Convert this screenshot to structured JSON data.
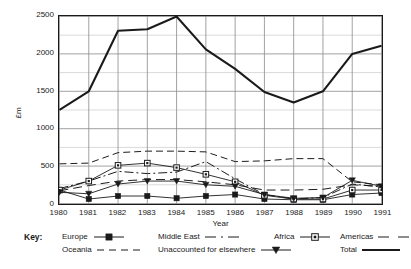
{
  "chart_data": {
    "type": "line",
    "title": "",
    "xlabel": "Year",
    "ylabel": "£m",
    "x": [
      1980,
      1981,
      1982,
      1983,
      1984,
      1985,
      1986,
      1987,
      1988,
      1989,
      1990,
      1991
    ],
    "categories": [
      "1980",
      "1981",
      "1982",
      "1983",
      "1984",
      "1985",
      "1986",
      "1987",
      "1988",
      "1989",
      "1990",
      "1991"
    ],
    "xlim": [
      1980,
      1991
    ],
    "ylim": [
      0,
      2500
    ],
    "ytick_values": [
      0,
      500,
      1000,
      1500,
      2000,
      2500
    ],
    "ytick_labels": [
      "0",
      "500",
      "1000",
      "1500",
      "2000",
      "2500"
    ],
    "y_minor_step": 250,
    "grid": "both axes, light grey minor gridlines every 250 on y and at each year on x",
    "legend_position": "below plot, two rows, labelled 'Key:'",
    "series": [
      {
        "name": "Europe",
        "style": "solid line with filled square markers",
        "marker": "filled-square",
        "dash": "solid",
        "values": [
          180,
          60,
          100,
          100,
          70,
          100,
          120,
          60,
          50,
          50,
          120,
          140
        ]
      },
      {
        "name": "Middle East",
        "style": "dash-dot line, no markers",
        "marker": "none",
        "dash": "dash-dot",
        "values": [
          200,
          300,
          430,
          400,
          420,
          560,
          330,
          120,
          60,
          80,
          260,
          220
        ]
      },
      {
        "name": "Africa",
        "style": "solid line with open square markers",
        "marker": "open-square",
        "dash": "solid",
        "values": [
          180,
          300,
          510,
          540,
          480,
          390,
          290,
          110,
          60,
          60,
          180,
          180
        ]
      },
      {
        "name": "Americas",
        "style": "long dashed line, no markers",
        "marker": "none",
        "dash": "long-dash",
        "values": [
          170,
          240,
          300,
          320,
          320,
          290,
          250,
          180,
          180,
          190,
          250,
          230
        ]
      },
      {
        "name": "Oceania",
        "style": "dashed line, no markers",
        "marker": "none",
        "dash": "dash",
        "values": [
          530,
          540,
          680,
          700,
          700,
          690,
          560,
          570,
          600,
          600,
          290,
          250
        ]
      },
      {
        "name": "Unaccounted for elsewhere",
        "style": "solid line with filled triangle markers",
        "marker": "filled-triangle",
        "dash": "solid",
        "values": [
          150,
          130,
          260,
          300,
          300,
          250,
          230,
          120,
          70,
          80,
          310,
          230
        ]
      },
      {
        "name": "Total",
        "style": "thick solid line, no markers",
        "marker": "none",
        "dash": "solid-thick",
        "values": [
          1250,
          1500,
          2310,
          2330,
          2500,
          2060,
          1800,
          1490,
          1350,
          1500,
          2000,
          2110
        ]
      }
    ],
    "annotations": []
  },
  "axes": {
    "y_title": "£m",
    "x_title": "Year"
  },
  "key": {
    "label": "Key:",
    "row1": [
      {
        "name": "Europe",
        "swatch": "solid-filled-square"
      },
      {
        "name": "Middle East",
        "swatch": "dash-dot"
      },
      {
        "name": "Africa",
        "swatch": "solid-open-square"
      },
      {
        "name": "Americas",
        "swatch": "long-dash"
      }
    ],
    "row2": [
      {
        "name": "Oceania",
        "swatch": "dash"
      },
      {
        "name": "Unaccounted for elsewhere",
        "swatch": "solid-filled-triangle"
      },
      {
        "name": "Total",
        "swatch": "solid-thick"
      }
    ]
  },
  "colors": {
    "ink": "#1a1a1a",
    "grid_minor": "#c9c9c9",
    "grid_major": "#8a8a8a",
    "background": "#ffffff"
  }
}
